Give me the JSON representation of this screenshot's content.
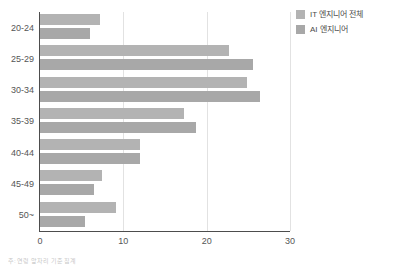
{
  "chart_data": {
    "type": "bar",
    "orientation": "horizontal",
    "title": "",
    "xlabel": "",
    "ylabel": "",
    "categories": [
      "20-24",
      "25-29",
      "30-34",
      "35-39",
      "40-44",
      "45-49",
      "50~"
    ],
    "series": [
      {
        "name": "IT 엔지니어 전체",
        "color": "#b3b3b3",
        "values": [
          7.2,
          22.7,
          24.8,
          17.3,
          12.0,
          7.4,
          9.1
        ]
      },
      {
        "name": "AI 엔지니어",
        "color": "#a8a8a8",
        "values": [
          6.0,
          25.6,
          26.4,
          18.7,
          12.0,
          6.5,
          5.4
        ]
      }
    ],
    "xlim": [
      0,
      30
    ],
    "xticks": [
      0,
      10,
      20,
      30
    ],
    "xtick_labels": [
      "0",
      "10",
      "20",
      "30"
    ],
    "grid": true,
    "grid_axis": "x",
    "legend_position": "top-right"
  },
  "legend": {
    "items": [
      {
        "label": "IT 엔지니어 전체",
        "swatch": "#b3b3b3"
      },
      {
        "label": "AI 엔지니어",
        "swatch": "#a8a8a8"
      }
    ]
  },
  "footnote": {
    "text": "주: 연령 앞자리 기준 집계"
  },
  "colors": {
    "axis": "#4d4d4d",
    "grid": "#e2e2e2",
    "tick_text": "#555555",
    "background": "#ffffff"
  }
}
